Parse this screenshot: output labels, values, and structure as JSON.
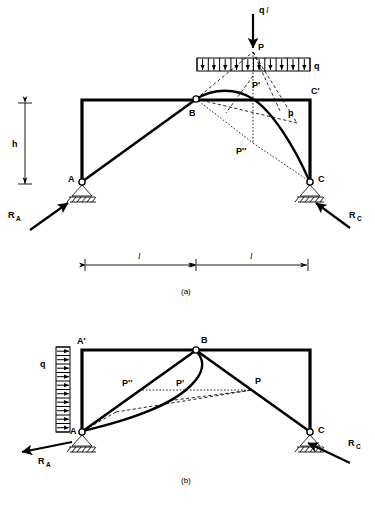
{
  "figure": {
    "panels": [
      {
        "id": "a",
        "caption": "(a)",
        "labels": {
          "load_resultant": "q",
          "load_resultant_italic": "l",
          "point_P": "P",
          "point_P_prime": "P'",
          "point_P_double_prime": "P''",
          "distributed_load": "q",
          "thrust_force": "p",
          "node_A": "A",
          "node_B": "B",
          "node_C": "C",
          "node_C_prime": "C'",
          "reaction_A": "R",
          "reaction_A_sub": "A",
          "reaction_C": "R",
          "reaction_C_sub": "C",
          "height_dim": "h",
          "span_left": "l",
          "span_right": "l"
        },
        "load_cells": 10
      },
      {
        "id": "b",
        "caption": "(b)",
        "labels": {
          "distributed_load": "q",
          "point_P": "P",
          "point_P_prime": "P'",
          "point_P_double_prime": "P''",
          "node_A": "A",
          "node_A_prime": "A'",
          "node_B": "B",
          "node_C": "C",
          "reaction_A": "R",
          "reaction_A_sub": "A",
          "reaction_C": "R",
          "reaction_C_sub": "C"
        },
        "load_cells": 10
      }
    ],
    "colors": {
      "ink": "#000000",
      "paper": "#ffffff"
    }
  }
}
